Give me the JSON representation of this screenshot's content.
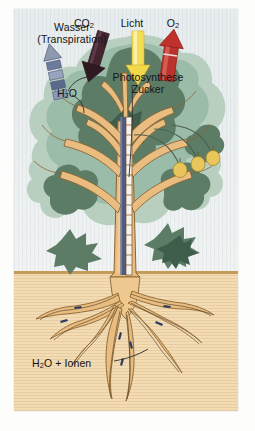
{
  "figure": {
    "kind": "schematic-diagram",
    "language": "de"
  },
  "colors": {
    "sky": "#e9edee",
    "soil": "#f3dcb4",
    "soil_line": "#c69a58",
    "canopy_light": "#b9cfc0",
    "canopy_mid": "#9dbdaa",
    "canopy_dark": "#5e7d67",
    "canopy_darkest": "#3f5d4b",
    "wood": "#e3b679",
    "wood_light": "#f0cf9f",
    "wood_outline": "#8a6434",
    "xylem_blue": "#50597f",
    "phloem_white": "#f6f2ea",
    "arrow_water": "#5b6a8c",
    "arrow_co2": "#4a2735",
    "arrow_licht": "#f3dc52",
    "arrow_o2": "#c0312c",
    "fruit": "#e8c65a",
    "text": "#141414"
  },
  "labels": {
    "wasser_line1": "Wasser",
    "wasser_line2": "(Transpiration)",
    "co2": "CO₂",
    "licht": "Licht",
    "o2": "O₂",
    "photosynthese": "Photosynthese",
    "zucker": "Zucker",
    "h2o": "H₂O",
    "h2o_ionen": "H₂O + Ionen"
  },
  "arrows": [
    {
      "name": "wasser-arrow",
      "label": "Wasser (Transpiration)",
      "color": "#5b6a8c",
      "direction": "up",
      "style": "segmented-striped"
    },
    {
      "name": "co2-arrow",
      "label": "CO₂",
      "color": "#4a2735",
      "direction": "down-right",
      "style": "solid"
    },
    {
      "name": "licht-arrow",
      "label": "Licht",
      "color": "#f3dc52",
      "direction": "down",
      "style": "solid"
    },
    {
      "name": "o2-arrow",
      "label": "O₂",
      "color": "#c0312c",
      "direction": "up",
      "style": "solid"
    }
  ],
  "callouts": [
    {
      "name": "photosynthese-callout",
      "text": "Photosynthese",
      "points_to": "leaf"
    },
    {
      "name": "zucker-callout",
      "text": "Zucker",
      "points_to": "phloem"
    },
    {
      "name": "h2o-callout",
      "text": "H₂O",
      "points_to": "leaf-stoma"
    },
    {
      "name": "ionen-callout",
      "text": "H₂O + Ionen",
      "points_to": "root"
    }
  ],
  "fruits": {
    "count": 3,
    "color": "#e8c65a",
    "name": "sugar-transport-fruit"
  },
  "trunk": {
    "xylem_label": "xylem-stripe",
    "phloem_label": "phloem-stripe"
  }
}
